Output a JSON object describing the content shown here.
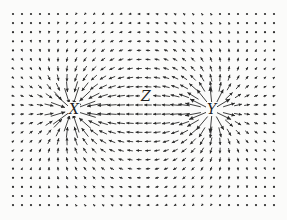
{
  "diagram": {
    "type": "vector-field",
    "width": 287,
    "height": 220,
    "grid": {
      "x0": 13,
      "y0": 14,
      "dx": 9.0,
      "dy": 9.1,
      "cols": 30,
      "rows": 22
    },
    "colors": {
      "arrow": "#2a2a2a",
      "background": "#fbfbfa"
    },
    "charges": [
      {
        "id": "X",
        "label": "X",
        "x": 73,
        "y": 110,
        "kind": "sink"
      },
      {
        "id": "Y",
        "label": "Y",
        "x": 211,
        "y": 110,
        "kind": "source"
      }
    ],
    "points": [
      {
        "id": "Z",
        "label": "Z",
        "x": 146,
        "y": 96
      }
    ]
  },
  "labels": {
    "x": "X",
    "y": "Y",
    "z": "Z"
  }
}
